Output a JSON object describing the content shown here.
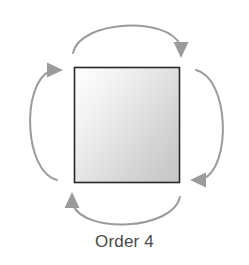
{
  "diagram": {
    "caption": "Order 4",
    "shape": {
      "name": "square",
      "fill_light": "#fbfbfb",
      "fill_dark": "#c9c9c9",
      "border_color": "#272727",
      "x": 74,
      "y": 67,
      "width": 106,
      "height": 116
    },
    "arrows": {
      "color": "#9b9b9b",
      "direction": "clockwise",
      "count": 4,
      "items": [
        {
          "position": "top",
          "from": "left",
          "to": "right",
          "head": "down"
        },
        {
          "position": "right",
          "from": "top",
          "to": "bottom",
          "head": "left"
        },
        {
          "position": "bottom",
          "from": "right",
          "to": "left",
          "head": "up"
        },
        {
          "position": "left",
          "from": "bottom",
          "to": "top",
          "head": "right"
        }
      ]
    },
    "background_color": "#ffffff"
  }
}
